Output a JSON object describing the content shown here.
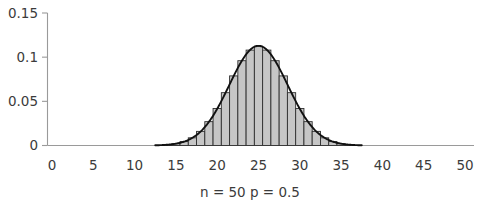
{
  "chart_data": {
    "type": "bar",
    "title": "",
    "subtitle": "",
    "caption": "n = 50    p = 0.5",
    "caption_parts": {
      "n_label": "n = 50",
      "p_label": "p = 0.5"
    },
    "xlabel": "",
    "ylabel": "",
    "xlim": [
      0,
      50
    ],
    "ylim": [
      0,
      0.15
    ],
    "grid": false,
    "legend": null,
    "x_tick_labels": [
      "0",
      "5",
      "10",
      "15",
      "20",
      "25",
      "30",
      "35",
      "40",
      "45",
      "50"
    ],
    "x_ticks": [
      0,
      5,
      10,
      15,
      20,
      25,
      30,
      35,
      40,
      45,
      50
    ],
    "y_tick_labels": [
      "0",
      "0.05",
      "0.1",
      "0.15"
    ],
    "y_ticks": [
      0,
      0.05,
      0.1,
      0.15
    ],
    "bar_width": 1,
    "categories": [
      14,
      15,
      16,
      17,
      18,
      19,
      20,
      21,
      22,
      23,
      24,
      25,
      26,
      27,
      28,
      29,
      30,
      31,
      32,
      33,
      34,
      35,
      36
    ],
    "values": [
      0.0012,
      0.002,
      0.0044,
      0.0087,
      0.016,
      0.027,
      0.0419,
      0.0598,
      0.0788,
      0.096,
      0.108,
      0.1123,
      0.108,
      0.096,
      0.0788,
      0.0598,
      0.0419,
      0.027,
      0.016,
      0.0087,
      0.0044,
      0.002,
      0.0009
    ],
    "series": [
      {
        "name": "Binomial probability",
        "type": "bar",
        "values": [
          0.0012,
          0.002,
          0.0044,
          0.0087,
          0.016,
          0.027,
          0.0419,
          0.0598,
          0.0788,
          0.096,
          0.108,
          0.1123,
          0.108,
          0.096,
          0.0788,
          0.0598,
          0.0419,
          0.027,
          0.016,
          0.0087,
          0.0044,
          0.002,
          0.0009
        ],
        "fill_color": "#c6c6c6",
        "edge_color": "#2e2e2e"
      },
      {
        "name": "Normal approximation curve",
        "type": "line",
        "mean": 25,
        "sigma": 3.5355,
        "peak_value": 0.1128,
        "x_range": [
          12.5,
          37.5
        ],
        "color": "#111111"
      }
    ],
    "colors": {
      "bar_fill": "#c6c6c6",
      "bar_edge": "#2e2e2e",
      "curve": "#111111",
      "axis": "#9a9a9a",
      "text": "#3b3b3b",
      "background": "#ffffff"
    }
  }
}
